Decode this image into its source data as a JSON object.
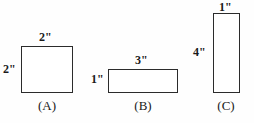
{
  "figure": {
    "background_color": "#fefefe",
    "stroke_color": "#2b2b2b",
    "text_color": "#1a1a1a"
  },
  "shapes": [
    {
      "id": "A",
      "caption": "(A)",
      "kind": "square",
      "top_label": "2\"",
      "left_label": "1\"",
      "width_in": 2,
      "height_in": 2
    },
    {
      "id": "B",
      "caption": "(B)",
      "kind": "rectangle",
      "top_label": "3\"",
      "left_label": "1\"",
      "width_in": 3,
      "height_in": 1
    },
    {
      "id": "C",
      "caption": "(C)",
      "kind": "rectangle",
      "top_label": "1\"",
      "left_label": "4\"",
      "width_in": 1,
      "height_in": 4
    }
  ],
  "labels": {
    "a_top": "2\"",
    "a_left": "2\"",
    "a_caption": "(A)",
    "b_top": "3\"",
    "b_left": "1\"",
    "b_caption": "(B)",
    "c_top": "1\"",
    "c_left": "4\"",
    "c_caption": "(C)"
  }
}
